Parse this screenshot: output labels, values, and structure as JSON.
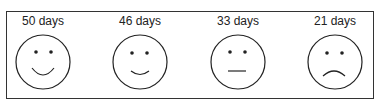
{
  "faces": [
    {
      "label": "50 days",
      "mood": "big-smile"
    },
    {
      "label": "46 days",
      "mood": "smile"
    },
    {
      "label": "33 days",
      "mood": "neutral"
    },
    {
      "label": "21 days",
      "mood": "frown"
    }
  ]
}
